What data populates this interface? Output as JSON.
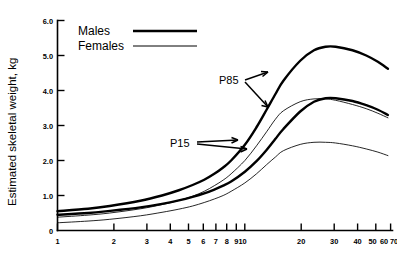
{
  "chart_data": {
    "type": "line",
    "title": "",
    "xlabel": "",
    "ylabel": "Estimated skeletal weight, kg",
    "xscale": "log",
    "xlim": [
      1,
      85
    ],
    "ylim": [
      0,
      6.0
    ],
    "grid": false,
    "legend_position": "top-left",
    "x_ticks": [
      1,
      2,
      3,
      4,
      5,
      6,
      7,
      8,
      9,
      10,
      20,
      30,
      40,
      50,
      60,
      70,
      80
    ],
    "x_tick_labels": [
      "1",
      "2",
      "3",
      "4",
      "5",
      "6",
      "7",
      "8",
      "910",
      "20",
      "30",
      "40",
      "50",
      "60",
      "70",
      "80"
    ],
    "y_ticks": [
      0,
      1.0,
      2.0,
      3.0,
      4.0,
      5.0,
      6.0
    ],
    "y_tick_labels": [
      "0",
      "1.0",
      "2.0",
      "3.0",
      "4.0",
      "5.0",
      "6.0"
    ],
    "legend": [
      {
        "name": "Males",
        "style": "thick-black-line"
      },
      {
        "name": "Females",
        "style": "thin-black-line"
      }
    ],
    "annotations": [
      {
        "text": "P85",
        "points_to": [
          "males-p85-curve",
          "females-p85-curve"
        ]
      },
      {
        "text": "P15",
        "points_to": [
          "males-p15-curve",
          "females-p15-curve"
        ]
      }
    ],
    "x": [
      1,
      1.5,
      2,
      3,
      4,
      5,
      6,
      7,
      8,
      9,
      10,
      12,
      14,
      16,
      18,
      20,
      25,
      30,
      35,
      40,
      50,
      60,
      70,
      80
    ],
    "series": [
      {
        "name": "Males P85",
        "sex": "Males",
        "percentile": "P85",
        "style": "thick",
        "values": [
          0.55,
          0.62,
          0.7,
          0.85,
          1.0,
          1.15,
          1.3,
          1.45,
          1.62,
          1.8,
          2.0,
          2.45,
          2.95,
          3.45,
          3.9,
          4.28,
          4.85,
          5.15,
          5.25,
          5.25,
          5.15,
          5.0,
          4.82,
          4.62
        ]
      },
      {
        "name": "Males P15",
        "sex": "Males",
        "percentile": "P15",
        "style": "thick",
        "values": [
          0.45,
          0.5,
          0.56,
          0.66,
          0.76,
          0.86,
          0.96,
          1.06,
          1.17,
          1.28,
          1.4,
          1.68,
          1.98,
          2.3,
          2.62,
          2.9,
          3.4,
          3.68,
          3.78,
          3.78,
          3.7,
          3.58,
          3.45,
          3.3
        ]
      },
      {
        "name": "Females P85",
        "sex": "Females",
        "percentile": "P85",
        "style": "thin",
        "values": [
          0.38,
          0.44,
          0.5,
          0.62,
          0.74,
          0.86,
          0.98,
          1.12,
          1.28,
          1.44,
          1.62,
          2.0,
          2.42,
          2.82,
          3.18,
          3.42,
          3.68,
          3.76,
          3.76,
          3.72,
          3.6,
          3.48,
          3.35,
          3.22
        ]
      },
      {
        "name": "Females P15",
        "sex": "Females",
        "percentile": "P15",
        "style": "thin",
        "values": [
          0.22,
          0.27,
          0.32,
          0.42,
          0.52,
          0.61,
          0.7,
          0.8,
          0.9,
          1.0,
          1.12,
          1.36,
          1.62,
          1.88,
          2.1,
          2.28,
          2.46,
          2.52,
          2.52,
          2.5,
          2.42,
          2.33,
          2.24,
          2.14
        ]
      }
    ]
  },
  "axis": {
    "y_title": "Estimated skeletal weight, kg"
  },
  "legend": {
    "males": "Males",
    "females": "Females"
  },
  "annotations": {
    "p85": "P85",
    "p15": "P15"
  },
  "caption": {
    "text": ""
  }
}
